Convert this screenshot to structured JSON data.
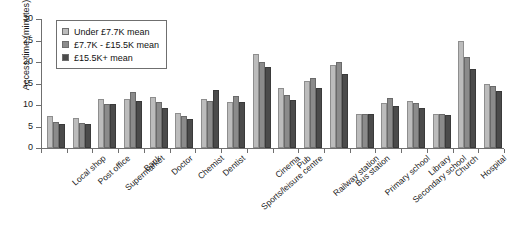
{
  "chart_data": {
    "type": "bar",
    "title": "",
    "xlabel": "",
    "ylabel": "Access time (minutes)",
    "ylim": [
      0,
      30
    ],
    "yticks": [
      0,
      5,
      10,
      15,
      20,
      25,
      30
    ],
    "grid": false,
    "legend_position": "top-left",
    "categories": [
      "Local shop",
      "Post office",
      "Supermarket",
      "Bank",
      "Doctor",
      "Chemist",
      "Dentist",
      "Sports/leisure centre",
      "Cinema",
      "Pub",
      "Railway station",
      "Bus station",
      "Primary school",
      "Secondary school",
      "Library",
      "Church",
      "Hospital",
      "Council office"
    ],
    "series": [
      {
        "name": "Under £7.7K mean",
        "color": "#bcbcbc",
        "values": [
          7.5,
          7.0,
          11.3,
          11.4,
          11.8,
          8.2,
          11.3,
          10.7,
          21.8,
          14.0,
          15.5,
          19.2,
          7.8,
          10.4,
          11.0,
          7.8,
          25.0,
          15.0
        ]
      },
      {
        "name": "£7.7K - £15.5K mean",
        "color": "#8b8b8b",
        "values": [
          6.0,
          5.8,
          10.3,
          13.0,
          10.7,
          7.5,
          11.0,
          12.0,
          20.0,
          12.4,
          16.3,
          20.0,
          7.8,
          11.6,
          10.4,
          7.8,
          21.2,
          14.4
        ]
      },
      {
        "name": "£15.5K+ mean",
        "color": "#4b4b4b",
        "values": [
          5.5,
          5.5,
          10.2,
          11.0,
          9.4,
          6.8,
          13.6,
          10.7,
          18.8,
          11.2,
          14.0,
          17.2,
          7.8,
          9.8,
          9.4,
          7.7,
          18.4,
          13.2
        ]
      }
    ]
  }
}
